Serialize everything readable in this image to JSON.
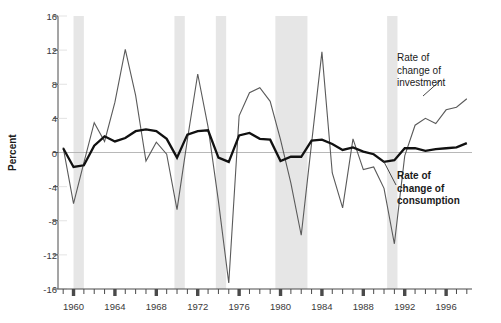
{
  "chart_data": {
    "type": "line",
    "title": "",
    "subtitle": "",
    "xlabel": "",
    "ylabel": "Percent",
    "xlim": [
      1958.5,
      1998.5
    ],
    "ylim": [
      -16,
      16
    ],
    "grid": false,
    "legend_position": "inline-annotation",
    "y_ticks": [
      16,
      12,
      8,
      4,
      0,
      -4,
      -8,
      -12,
      -16
    ],
    "y_tick_labels": [
      "16",
      "12",
      "8",
      "4",
      "0",
      "-4",
      "-8",
      "-12",
      "-16"
    ],
    "x_ticks_major": [
      1960,
      1964,
      1968,
      1972,
      1976,
      1980,
      1984,
      1988,
      1992,
      1996
    ],
    "x_tick_labels": [
      "1960",
      "1964",
      "1968",
      "1972",
      "1976",
      "1980",
      "1984",
      "1988",
      "1992",
      "1996"
    ],
    "x_ticks_minor": [
      1959,
      1961,
      1962,
      1963,
      1965,
      1966,
      1967,
      1969,
      1970,
      1971,
      1973,
      1974,
      1975,
      1977,
      1978,
      1979,
      1981,
      1982,
      1983,
      1985,
      1986,
      1987,
      1989,
      1990,
      1991,
      1993,
      1994,
      1995,
      1997,
      1998
    ],
    "zero_line": 0,
    "shaded_bands_label": "recession bands",
    "shaded_bands": [
      {
        "start": 1960.0,
        "end": 1961.0
      },
      {
        "start": 1969.75,
        "end": 1970.75
      },
      {
        "start": 1973.75,
        "end": 1974.75
      },
      {
        "start": 1979.5,
        "end": 1982.6
      },
      {
        "start": 1990.3,
        "end": 1991.3
      }
    ],
    "x": [
      1959,
      1960,
      1961,
      1962,
      1963,
      1964,
      1965,
      1966,
      1967,
      1968,
      1969,
      1970,
      1971,
      1972,
      1973,
      1974,
      1975,
      1976,
      1977,
      1978,
      1979,
      1980,
      1981,
      1982,
      1983,
      1984,
      1985,
      1986,
      1987,
      1988,
      1989,
      1990,
      1991,
      1992,
      1993,
      1994,
      1995,
      1996,
      1997,
      1998
    ],
    "series": [
      {
        "name": "Rate of change of investment",
        "color": "#5a5a5a",
        "line_width": 1.1,
        "values": [
          0.6,
          -6.0,
          -1.2,
          3.5,
          1.3,
          5.9,
          12.1,
          6.7,
          -1.0,
          1.2,
          -0.2,
          -6.7,
          1.5,
          9.2,
          3.0,
          -5.7,
          -15.3,
          4.3,
          7.0,
          7.6,
          6.0,
          1.5,
          -3.6,
          -9.7,
          1.1,
          11.8,
          -2.4,
          -6.5,
          1.6,
          -2.0,
          -1.7,
          -4.2,
          -10.7,
          -0.4,
          3.2,
          4.0,
          3.4,
          5.0,
          5.3,
          6.3
        ]
      },
      {
        "name": "Rate of change of consumption",
        "color": "#111111",
        "line_width": 2.3,
        "values": [
          0.5,
          -1.7,
          -1.5,
          0.8,
          1.9,
          1.3,
          1.7,
          2.5,
          2.7,
          2.5,
          1.6,
          -0.6,
          2.1,
          2.5,
          2.6,
          -0.6,
          -1.1,
          2.0,
          2.3,
          1.6,
          1.5,
          -1.0,
          -0.5,
          -0.5,
          1.4,
          1.5,
          1.0,
          0.3,
          0.6,
          0.1,
          -0.2,
          -1.1,
          -0.9,
          0.5,
          0.5,
          0.2,
          0.4,
          0.5,
          0.6,
          1.1
        ]
      }
    ],
    "annotations": [
      {
        "id": "investment",
        "text": "Rate of\nchange of\ninvestment",
        "bold": false,
        "x": 397,
        "y": 52
      },
      {
        "id": "consumption",
        "text": "Rate of\nchange of\nconsumption",
        "bold": true,
        "x": 397,
        "y": 170
      }
    ]
  },
  "axis": {
    "y_label": "Percent"
  },
  "colors": {
    "investment_line": "#5a5a5a",
    "consumption_line": "#111111",
    "band_fill": "#e6e6e6",
    "axis": "#4a4a4a",
    "zero_line": "#b0b0b0",
    "text": "#1a1a1a"
  }
}
